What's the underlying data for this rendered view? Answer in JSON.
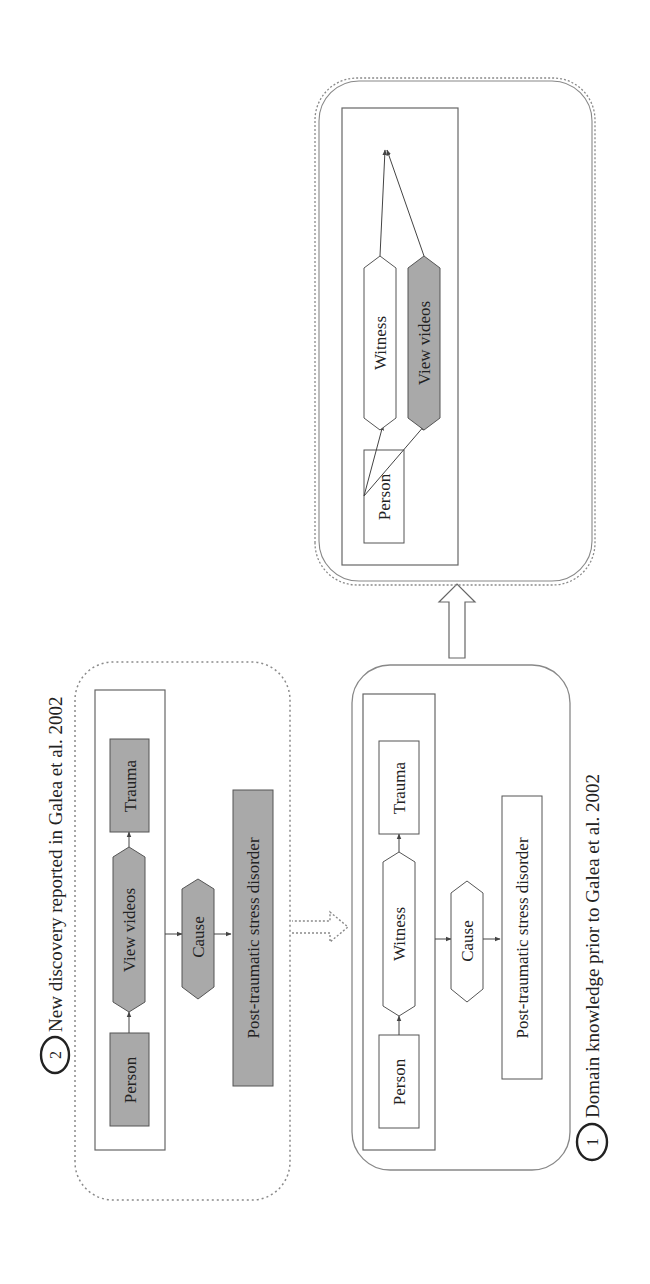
{
  "figure": {
    "growth_section": {
      "title": "The growth of domain knowledge",
      "modes": [
        {
          "label": "Incremental"
        },
        {
          "label": "Split"
        },
        {
          "label": "Merge"
        }
      ]
    },
    "panels": [
      {
        "number": "1",
        "caption": "Domain knowledge prior to Galea et al. 2002",
        "nodes": {
          "person": "Person",
          "witness": "Witness",
          "trauma": "Trauma",
          "cause": "Cause",
          "ptsd": "Post-traumatic stress disorder"
        },
        "highlighted": false
      },
      {
        "number": "2",
        "caption": "New discovery reported in Galea et al. 2002",
        "nodes": {
          "person": "Person",
          "view_videos": "View videos",
          "trauma": "Trauma",
          "cause": "Cause",
          "ptsd": "Post-traumatic stress disorder"
        },
        "highlighted": true
      },
      {
        "number": "3",
        "caption": "Updated domain knowledge",
        "nodes": {
          "person": "Person",
          "witness": "Witness",
          "view_videos": "View videos",
          "trauma": "Trauma",
          "cause": "Cause",
          "ptsd": "Post-traumatic stress disorder"
        },
        "highlighted_nodes": [
          "View videos"
        ]
      }
    ],
    "colors": {
      "highlight_fill": "#a9a9a9",
      "stroke": "#555555",
      "dotted_stroke": "#8a8a8a"
    }
  }
}
